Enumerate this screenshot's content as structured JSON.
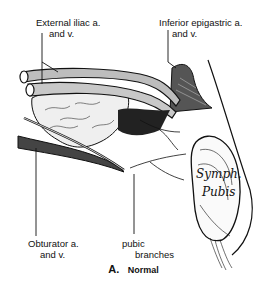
{
  "figure": {
    "panel_letter": "A.",
    "panel_title": "Normal"
  },
  "labels": {
    "external_iliac": {
      "line1": "External iliac a.",
      "line2": "and v."
    },
    "inferior_epigastric": {
      "line1": "Inferior epigastric a.",
      "line2": "and v."
    },
    "obturator": {
      "line1": "Obturator a.",
      "line2": "and v."
    },
    "pubic_branches": {
      "line1": "pubic",
      "line2": "branches"
    },
    "symphysis": {
      "line1": "Symph.",
      "line2": "Pubis"
    }
  },
  "colors": {
    "ink": "#111111",
    "vessel_fill": "#bdbdbd",
    "tissue_fill": "#e8e8e8",
    "background": "#ffffff"
  }
}
